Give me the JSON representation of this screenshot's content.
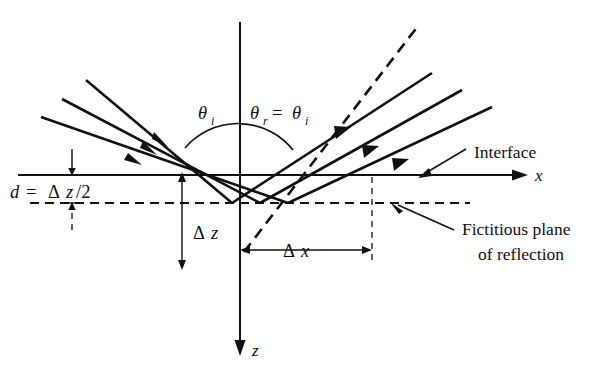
{
  "figure": {
    "domain": "diagram",
    "kind": "optics-ray-reflection-schematic",
    "background_color": "#ffffff",
    "line_color": "#111111"
  },
  "labels": {
    "theta_i": "θ",
    "theta_i_sub": "i",
    "theta_r": "θ",
    "theta_r_sub": "r",
    "equals": "=",
    "theta_r_eq_theta_i_theta2": "θ",
    "theta_r_eq_theta_i_sub2": "i",
    "interface": "Interface",
    "fictitious_line1": "Fictitious plane",
    "fictitious_line2": "of reflection",
    "axis_x": "x",
    "axis_z": "z",
    "d_label_d": "d",
    "d_label_eq": "=",
    "d_label_delta": "Δ",
    "d_label_z": "z",
    "d_label_half": "/2",
    "delta_z_delta": "Δ",
    "delta_z_z": "z",
    "delta_x_delta": "Δ",
    "delta_x_x": "x"
  },
  "geometry": {
    "origin": {
      "x": 240,
      "y": 175
    },
    "interface_y": 175,
    "fictitious_plane_y": 203,
    "x_axis": {
      "x1": 18,
      "y1": 175,
      "x2": 520,
      "y2": 175
    },
    "z_axis": {
      "x1": 240,
      "y1": 22,
      "x2": 240,
      "y2": 348
    },
    "delta_z_value_px": 28,
    "delta_x_span": {
      "x1": 240,
      "x2": 372
    },
    "ray_slope_deg": 40,
    "incident_rays": [
      {
        "x1": 86,
        "y1": 80,
        "x2": 232,
        "y2": 203
      },
      {
        "x1": 68,
        "y1": 96,
        "x2": 260,
        "y2": 203
      },
      {
        "x1": 50,
        "y1": 112,
        "x2": 288,
        "y2": 203
      }
    ],
    "reflected_rays": [
      {
        "x1": 232,
        "y1": 203,
        "x2": 440,
        "y2": 70
      },
      {
        "x1": 260,
        "y1": 203,
        "x2": 468,
        "y2": 86
      },
      {
        "x1": 288,
        "y1": 203,
        "x2": 496,
        "y2": 102
      }
    ],
    "dashed_center_ray": {
      "x1": 244,
      "y1": 252,
      "x2": 420,
      "y2": 24
    },
    "fictitious_plane_dash": {
      "x1": 30,
      "y1": 203,
      "x2": 470,
      "y2": 203
    }
  },
  "annotations": {
    "interface_leader": {
      "from_x": 468,
      "from_y": 150,
      "to_x": 420,
      "to_y": 176
    },
    "fictitious_leader": {
      "from_x": 452,
      "from_y": 228,
      "to_x": 392,
      "to_y": 204
    }
  },
  "icons": {
    "arrow_head": "triangular-arrowhead",
    "dimension_arrow": "double-headed-dimension-arrow"
  }
}
